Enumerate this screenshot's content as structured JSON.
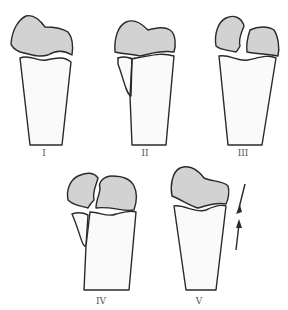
{
  "figure": {
    "panels": [
      {
        "label": "I"
      },
      {
        "label": "II"
      },
      {
        "label": "III"
      },
      {
        "label": "IV"
      },
      {
        "label": "V"
      }
    ],
    "colors": {
      "epiphysis": "#d2d2d2",
      "outline": "#2a2a2a",
      "bone": "#fafafa"
    }
  }
}
